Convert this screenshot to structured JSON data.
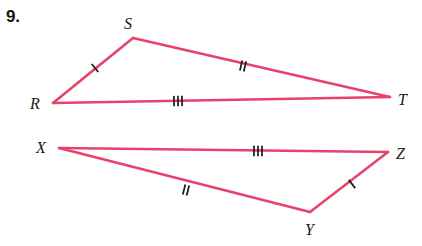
{
  "problem": {
    "number": "9."
  },
  "figure": {
    "stroke_color": "#e8426b",
    "label_color": "#1a1a1a",
    "tick_color": "#1a1a1a",
    "background": "#ffffff"
  },
  "triangles": [
    {
      "name": "triangle-rst",
      "vertices": [
        {
          "label": "R",
          "x": 53,
          "y": 103,
          "label_x": 30,
          "label_y": 96
        },
        {
          "label": "S",
          "x": 133,
          "y": 38,
          "label_x": 124,
          "label_y": 16
        },
        {
          "label": "T",
          "x": 390,
          "y": 97,
          "label_x": 398,
          "label_y": 92
        }
      ],
      "sides": [
        {
          "name": "side-rs",
          "from": "R",
          "to": "S",
          "ticks": 1,
          "tick_x": 95,
          "tick_y": 68
        },
        {
          "name": "side-st",
          "from": "S",
          "to": "T",
          "ticks": 2,
          "tick_x": 243,
          "tick_y": 66
        },
        {
          "name": "side-rt",
          "from": "R",
          "to": "T",
          "ticks": 3,
          "tick_x": 178,
          "tick_y": 101
        }
      ]
    },
    {
      "name": "triangle-xyz",
      "vertices": [
        {
          "label": "X",
          "x": 59,
          "y": 148,
          "label_x": 36,
          "label_y": 140
        },
        {
          "label": "Z",
          "x": 388,
          "y": 152,
          "label_x": 396,
          "label_y": 146
        },
        {
          "label": "Y",
          "x": 310,
          "y": 212,
          "label_x": 305,
          "label_y": 222
        }
      ],
      "sides": [
        {
          "name": "side-xz",
          "from": "X",
          "to": "Z",
          "ticks": 3,
          "tick_x": 258,
          "tick_y": 151
        },
        {
          "name": "side-xy",
          "from": "X",
          "to": "Y",
          "ticks": 2,
          "tick_x": 186,
          "tick_y": 190
        },
        {
          "name": "side-yz",
          "from": "Y",
          "to": "Z",
          "ticks": 1,
          "tick_x": 352,
          "tick_y": 184
        }
      ]
    }
  ]
}
